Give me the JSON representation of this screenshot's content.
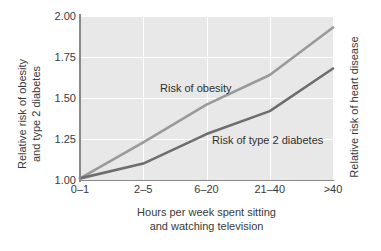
{
  "chart_data": {
    "type": "line",
    "title": "",
    "subtitle": "",
    "categories": [
      "0–1",
      "2–5",
      "6–20",
      "21–40",
      ">40"
    ],
    "xlabel": "Hours per week spent sitting and watching television",
    "xlabel_line1": "Hours per week spent sitting",
    "xlabel_line2": "and watching television",
    "ylabel": "Relative risk of obesity and type 2 diabetes",
    "ylabel_line1": "Relative risk of obesity",
    "ylabel_line2": "and type 2 diabetes",
    "y2label": "Relative risk of heart disease",
    "ylim": [
      1.0,
      2.0
    ],
    "yticks": [
      "1.00",
      "1.25",
      "1.50",
      "1.75",
      "2.00"
    ],
    "ytick_values": [
      1.0,
      1.25,
      1.5,
      1.75,
      2.0
    ],
    "grid": true,
    "legend": "inline-annotations",
    "series": [
      {
        "name": "Risk of obesity",
        "values": [
          1.01,
          1.23,
          1.46,
          1.64,
          1.93
        ],
        "color": "#9a9a9a"
      },
      {
        "name": "Risk of type 2 diabetes",
        "values": [
          1.01,
          1.1,
          1.28,
          1.42,
          1.68
        ],
        "color": "#6e6e6e"
      }
    ],
    "annotations": [
      {
        "text": "Risk of obesity",
        "series": "Risk of obesity"
      },
      {
        "text": "Risk of type 2 diabetes",
        "series": "Risk of type 2 diabetes"
      }
    ],
    "colors": {
      "plot_background": "#e8e8e8",
      "gridline": "#ffffff",
      "axis": "#8a8a8a",
      "text": "#3a3a3a",
      "series_obesity": "#9a9a9a",
      "series_diabetes": "#6e6e6e"
    }
  }
}
